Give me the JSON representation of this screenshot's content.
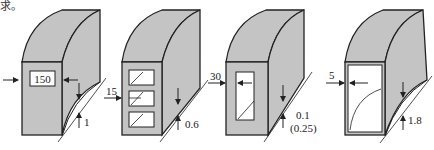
{
  "caption_fragment": "求。",
  "figures": [
    {
      "id": "a",
      "inner_label": "150",
      "arrow_label": "",
      "gap_label": "1",
      "gap_label2": ""
    },
    {
      "id": "b",
      "inner_label": "",
      "arrow_label": "15",
      "gap_label": "0.6",
      "gap_label2": ""
    },
    {
      "id": "c",
      "inner_label": "",
      "arrow_label": "30",
      "gap_label": "0.1",
      "gap_label2": "(0.25)"
    },
    {
      "id": "d",
      "inner_label": "",
      "arrow_label": "5",
      "gap_label": "1.8",
      "gap_label2": ""
    }
  ],
  "colors": {
    "fill": "#c4c4c4",
    "stroke": "#222222",
    "background": "#ffffff"
  }
}
